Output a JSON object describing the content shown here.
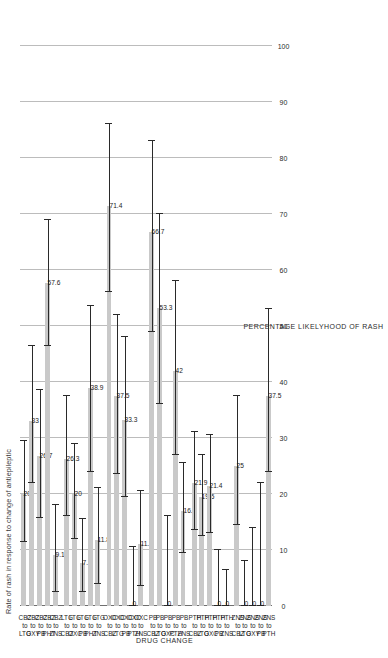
{
  "chart_data": {
    "type": "bar",
    "title": "Rate of rash in response to change of antiepileptic",
    "xlabel": "DRUG CHANGE",
    "ylabel": "PERCENTAGE LIKELYHOOD OF RASH",
    "ylim": [
      0,
      100
    ],
    "yticks": [
      0,
      10,
      20,
      30,
      40,
      50,
      60,
      70,
      80,
      90,
      100
    ],
    "grid": true,
    "legend": "none",
    "orientation": "horizontal-rotated",
    "bar_color": "#c9c9c9",
    "error_color": "#2a2a2a",
    "categories": [
      "CBZ to LTG",
      "CBZ to OXY",
      "CBZ to PB",
      "CBZ to PHT",
      "CBZ to ZNS",
      "LTG to CBZ",
      "LTG to OXC",
      "LTG to PB",
      "LTG to PHT",
      "LTG to ZNS",
      "OXC to CBZ",
      "OXC to LTG",
      "OXC to PB",
      "OXC to PTH",
      "OXC to ZNS",
      "PB to CBZ",
      "PB to LTG",
      "PB to OXC",
      "PB to PTH",
      "PB to ZNS",
      "PTH to CBZ",
      "PTH to LTG",
      "PTH to OXC",
      "PTH to PB",
      "PTH to ZNS",
      "ZNS to CBZ",
      "ZNS to LTG",
      "ZNS to OXY",
      "ZNS to PB",
      "ZNS to PTH"
    ],
    "category_lines": [
      [
        "CBZ",
        "to",
        "LTG"
      ],
      [
        "CBZ",
        "to",
        "OXY"
      ],
      [
        "CBZ",
        "to",
        "PB"
      ],
      [
        "CBZ",
        "to",
        "PHT"
      ],
      [
        "CBZ",
        "to",
        "ZNS"
      ],
      [
        "LTG",
        "to",
        "CBZ"
      ],
      [
        "LTG",
        "to",
        "OXC"
      ],
      [
        "LTG",
        "to",
        "PB"
      ],
      [
        "LTG",
        "to",
        "PHT"
      ],
      [
        "LTG",
        "to",
        "ZNS"
      ],
      [
        "OXC",
        "to",
        "CBZ"
      ],
      [
        "OXC",
        "to",
        "LTG"
      ],
      [
        "OXC",
        "to",
        "PB"
      ],
      [
        "OXC",
        "to",
        "PTH"
      ],
      [
        "OXC",
        "to",
        "ZNS"
      ],
      [
        "PB",
        "to",
        "CBZ"
      ],
      [
        "PB",
        "to",
        "LTG"
      ],
      [
        "PB",
        "to",
        "OXC"
      ],
      [
        "PB",
        "to",
        "PTH"
      ],
      [
        "PB",
        "to",
        "ZNS"
      ],
      [
        "PTH",
        "to",
        "CBZ"
      ],
      [
        "PTH",
        "to",
        "LTG"
      ],
      [
        "PTH",
        "to",
        "OXC"
      ],
      [
        "PTH",
        "to",
        "PB"
      ],
      [
        "PTH",
        "to",
        "ZNS"
      ],
      [
        "ZNS",
        "to",
        "CBZ"
      ],
      [
        "ZNS",
        "to",
        "LTG"
      ],
      [
        "ZNS",
        "to",
        "OXY"
      ],
      [
        "ZNS",
        "to",
        "PB"
      ],
      [
        "ZNS",
        "to",
        "PTH"
      ]
    ],
    "values": [
      20,
      33,
      26.7,
      57.6,
      9.1,
      26.3,
      20,
      7.7,
      38.9,
      11.8,
      71.4,
      37.5,
      33.3,
      0,
      11.1,
      66.7,
      53.3,
      0,
      42,
      16.9,
      21.9,
      19.5,
      21.4,
      0,
      0,
      25,
      0,
      0,
      0,
      37.5
    ],
    "value_labels": [
      "20",
      "33",
      "26.7",
      "57.6",
      "9.1",
      "26.3",
      "20",
      "7.7",
      "38.9",
      "11.8",
      "71.4",
      "37.5",
      "33.3",
      "0",
      "11.1",
      "66.7",
      "53.3",
      "0",
      "42",
      "16.9",
      "21.9",
      "19.5",
      "21.4",
      "0",
      "0",
      "25",
      "0",
      "0",
      "0",
      "37.5"
    ],
    "error_low": [
      11.5,
      22.0,
      15.8,
      46.5,
      2.5,
      16.0,
      12.0,
      2.5,
      24.0,
      4.0,
      56.0,
      23.5,
      19.5,
      0,
      3.5,
      49.0,
      36.0,
      0,
      27.0,
      9.5,
      13.5,
      12.5,
      13.0,
      0,
      0,
      14.5,
      0,
      0,
      0,
      24.0
    ],
    "error_high": [
      29.5,
      46.5,
      38.5,
      69.0,
      18.0,
      37.5,
      29.0,
      15.5,
      53.5,
      21.0,
      86.0,
      52.0,
      48.0,
      10.5,
      20.5,
      83.0,
      70.0,
      16.0,
      58.0,
      25.5,
      31.0,
      27.0,
      30.5,
      10.0,
      6.5,
      37.5,
      8.0,
      14.0,
      22.0,
      53.0
    ]
  }
}
